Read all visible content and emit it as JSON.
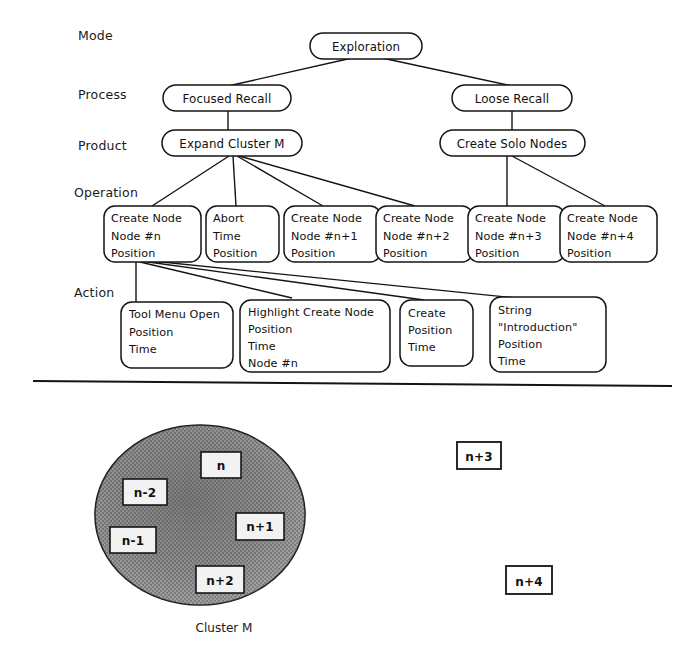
{
  "diagram": {
    "row_labels": [
      {
        "id": "mode",
        "label": "Mode"
      },
      {
        "id": "process",
        "label": "Process"
      },
      {
        "id": "product",
        "label": "Product"
      },
      {
        "id": "operation",
        "label": "Operation"
      },
      {
        "id": "action",
        "label": "Action"
      }
    ],
    "mode_nodes": [
      {
        "id": "exploration",
        "label": "Exploration"
      }
    ],
    "process_nodes": [
      {
        "id": "focused-recall",
        "label": "Focused Recall"
      },
      {
        "id": "loose-recall",
        "label": "Loose Recall"
      }
    ],
    "product_nodes": [
      {
        "id": "expand-cluster-m",
        "label": "Expand Cluster M"
      },
      {
        "id": "create-solo-nodes",
        "label": "Create Solo Nodes"
      }
    ],
    "operation_nodes": [
      {
        "id": "op-create-node-n",
        "lines": [
          "Create Node",
          "Node #n",
          "Position"
        ]
      },
      {
        "id": "op-abort",
        "lines": [
          "Abort",
          "Time",
          "Position"
        ]
      },
      {
        "id": "op-create-node-n1",
        "lines": [
          "Create Node",
          "Node #n+1",
          "Position"
        ]
      },
      {
        "id": "op-create-node-n2",
        "lines": [
          "Create Node",
          "Node #n+2",
          "Position"
        ]
      },
      {
        "id": "op-create-node-n3",
        "lines": [
          "Create Node",
          "Node #n+3",
          "Position"
        ]
      },
      {
        "id": "op-create-node-n4",
        "lines": [
          "Create Node",
          "Node #n+4",
          "Position"
        ]
      }
    ],
    "action_nodes": [
      {
        "id": "act-tool-menu-open",
        "lines": [
          "Tool Menu Open",
          "Position",
          "Time"
        ]
      },
      {
        "id": "act-highlight-create-node",
        "lines": [
          "Highlight Create Node",
          "Position",
          "Time",
          "Node #n"
        ]
      },
      {
        "id": "act-create",
        "lines": [
          "Create",
          "Position",
          "Time"
        ]
      },
      {
        "id": "act-string-introduction",
        "lines": [
          "String",
          "\"Introduction\"",
          "Position",
          "Time"
        ]
      }
    ],
    "cluster": {
      "caption": "Cluster M",
      "nodes": [
        {
          "id": "cluster-node-n",
          "label": "n"
        },
        {
          "id": "cluster-node-n-minus-2",
          "label": "n-2"
        },
        {
          "id": "cluster-node-n-minus-1",
          "label": "n-1"
        },
        {
          "id": "cluster-node-n-plus-1",
          "label": "n+1"
        },
        {
          "id": "cluster-node-n-plus-2",
          "label": "n+2"
        }
      ]
    },
    "solo_nodes": [
      {
        "id": "solo-node-n-plus-3",
        "label": "n+3"
      },
      {
        "id": "solo-node-n-plus-4",
        "label": "n+4"
      }
    ],
    "colors": {
      "ink": "#141414",
      "paper": "#ffffff",
      "cluster_fill_dark": "#6e6e6e",
      "cluster_fill_light": "#a8a8a8",
      "node_fill": "#f2f2f2"
    }
  }
}
